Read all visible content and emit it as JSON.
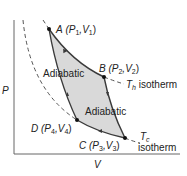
{
  "axes": {
    "ylabel": "P",
    "xlabel": "V"
  },
  "points": {
    "A": {
      "name": "A",
      "label": "(P",
      "p": "1",
      "v": "1"
    },
    "B": {
      "name": "B",
      "label": "(P",
      "p": "2",
      "v": "2"
    },
    "C": {
      "name": "C",
      "label": "(P",
      "p": "3",
      "v": "3"
    },
    "D": {
      "name": "D",
      "label": "(P",
      "p": "4",
      "v": "4"
    }
  },
  "labels": {
    "adiabatic_left": "Adiabatic",
    "adiabatic_right": "Adiabatic",
    "th_symbol": "T",
    "th_sub": "h",
    "th_word": "isotherm",
    "tc_symbol": "T",
    "tc_sub": "c",
    "tc_word": "isotherm"
  },
  "colors": {
    "fill": "#d9d9d9",
    "curve": "#3a3a3a",
    "dashed": "#555555",
    "axis": "#666666"
  }
}
